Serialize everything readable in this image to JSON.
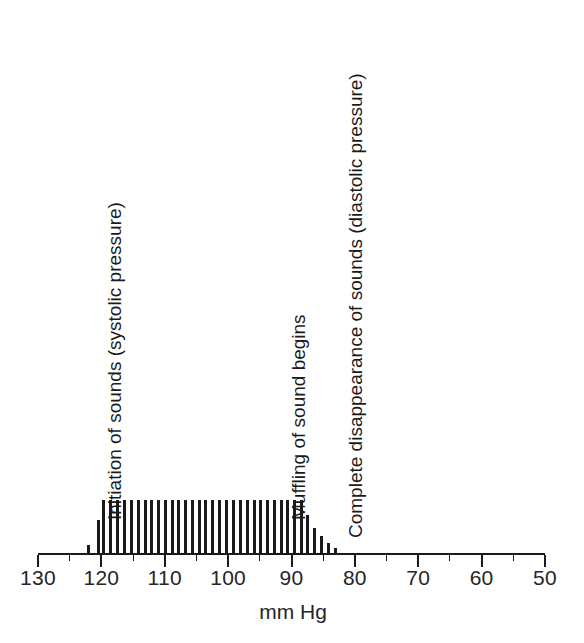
{
  "figure": {
    "caption_absent": true
  },
  "chart_data": {
    "type": "bar",
    "title": "",
    "subtitle": "",
    "xlabel": "mm Hg",
    "ylabel": "",
    "xlim": [
      130,
      50
    ],
    "ylim": [
      0,
      60
    ],
    "grid": false,
    "legend": null,
    "axis_direction": "decreasing left-to-right",
    "x_tick_labels": [
      "130",
      "120",
      "110",
      "100",
      "90",
      "80",
      "70",
      "60",
      "50"
    ],
    "x_major_ticks": [
      130,
      120,
      110,
      100,
      90,
      80,
      70,
      60,
      50
    ],
    "x_minor_ticks": [
      125,
      115,
      105,
      95,
      85,
      75,
      65,
      55
    ],
    "x": [
      122.0,
      120.5,
      119.6,
      118.5,
      117.4,
      116.3,
      115.3,
      114.2,
      113.1,
      112.1,
      111.0,
      109.9,
      108.8,
      107.8,
      106.7,
      105.6,
      104.5,
      103.5,
      102.4,
      101.3,
      100.2,
      99.2,
      98.1,
      97.0,
      95.9,
      94.9,
      93.8,
      92.7,
      91.6,
      90.6,
      89.5,
      88.4,
      87.4,
      86.3,
      85.2,
      84.1,
      83.1
    ],
    "values": [
      8,
      33,
      53,
      53,
      53,
      53,
      53,
      53,
      53,
      53,
      53,
      53,
      53,
      53,
      53,
      53,
      53,
      53,
      53,
      53,
      53,
      53,
      53,
      53,
      53,
      53,
      53,
      53,
      53,
      53,
      53,
      53,
      38,
      25,
      17,
      10,
      5
    ],
    "value_units": "relative sound amplitude (arbitrary units)",
    "annotations": [
      {
        "name": "systolic-annotation",
        "text": "Initiation of sounds (systolic pressure)",
        "x": 120,
        "orientation": "vertical"
      },
      {
        "name": "muffling-annotation",
        "text": "Muffling of sound begins",
        "x": 91,
        "orientation": "vertical"
      },
      {
        "name": "diastolic-annotation",
        "text": "Complete disappearance of sounds (diastolic pressure)",
        "x": 82,
        "orientation": "vertical"
      }
    ],
    "colors": {
      "bar": "#1a1a1a",
      "axis": "#1a1a1a",
      "text": "#1a1a1a",
      "background": "#ffffff"
    }
  }
}
